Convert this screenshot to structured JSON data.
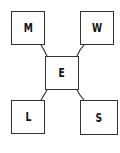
{
  "diagram": {
    "nodes": [
      {
        "id": "M",
        "label": "M",
        "position": "top-left"
      },
      {
        "id": "W",
        "label": "W",
        "position": "top-right"
      },
      {
        "id": "E",
        "label": "E",
        "position": "center"
      },
      {
        "id": "L",
        "label": "L",
        "position": "bottom-left"
      },
      {
        "id": "S",
        "label": "S",
        "position": "bottom-right"
      }
    ],
    "edges": [
      {
        "from": "E",
        "to": "M"
      },
      {
        "from": "E",
        "to": "W"
      },
      {
        "from": "E",
        "to": "L"
      },
      {
        "from": "E",
        "to": "S"
      }
    ]
  }
}
